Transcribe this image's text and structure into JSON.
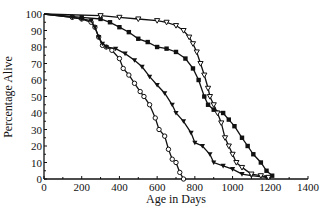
{
  "chart_data": {
    "type": "line",
    "title": "",
    "xlabel": "Age in Days",
    "ylabel": "Percentage Alive",
    "xlim": [
      0,
      1400
    ],
    "ylim": [
      0,
      100
    ],
    "x_ticks": [
      0,
      200,
      400,
      600,
      800,
      1000,
      1200,
      1400
    ],
    "y_ticks": [
      0,
      10,
      20,
      30,
      40,
      50,
      60,
      70,
      80,
      90,
      100
    ],
    "grid": false,
    "legend": null,
    "series": [
      {
        "name": "open-circles",
        "marker": "open-circle",
        "x": [
          0,
          150,
          200,
          250,
          270,
          290,
          310,
          330,
          360,
          400,
          420,
          450,
          480,
          510,
          530,
          560,
          590,
          610,
          640,
          660,
          680,
          700,
          720,
          740
        ],
        "y": [
          100,
          98,
          97,
          95,
          92,
          86,
          81,
          80,
          78,
          73,
          67,
          63,
          58,
          53,
          50,
          45,
          37,
          30,
          26,
          18,
          12,
          10,
          4,
          0
        ]
      },
      {
        "name": "filled-down-triangles",
        "marker": "filled-triangle-down",
        "x": [
          0,
          150,
          200,
          250,
          270,
          290,
          310,
          330,
          380,
          430,
          480,
          520,
          560,
          600,
          640,
          680,
          700,
          740,
          780,
          800,
          840,
          880,
          900,
          950,
          1000,
          1050,
          1100,
          1180
        ],
        "y": [
          100,
          98,
          97,
          96,
          92,
          86,
          82,
          80,
          79,
          76,
          72,
          68,
          62,
          57,
          52,
          45,
          40,
          35,
          28,
          22,
          20,
          15,
          10,
          8,
          6,
          3,
          2,
          1
        ]
      },
      {
        "name": "filled-squares",
        "marker": "filled-square",
        "x": [
          0,
          200,
          300,
          350,
          400,
          450,
          500,
          550,
          600,
          650,
          700,
          750,
          790,
          820,
          850,
          870,
          900,
          950,
          980,
          1010,
          1050,
          1080,
          1110,
          1150,
          1180,
          1210
        ],
        "y": [
          100,
          98,
          97,
          95,
          92,
          89,
          85,
          83,
          80,
          79,
          77,
          73,
          67,
          60,
          50,
          45,
          42,
          40,
          36,
          32,
          25,
          20,
          15,
          10,
          5,
          2
        ]
      },
      {
        "name": "open-down-triangles",
        "marker": "open-triangle-down",
        "x": [
          0,
          300,
          400,
          500,
          600,
          650,
          700,
          740,
          770,
          790,
          810,
          830,
          850,
          870,
          880,
          900,
          920,
          940,
          960,
          980,
          1000,
          1020,
          1050,
          1100,
          1150,
          1190
        ],
        "y": [
          100,
          99,
          98,
          97,
          96,
          95,
          93,
          90,
          86,
          82,
          77,
          70,
          63,
          55,
          50,
          45,
          40,
          34,
          25,
          20,
          15,
          10,
          7,
          3,
          2,
          1
        ]
      }
    ]
  },
  "axes": {
    "xlabel": "Age in Days",
    "ylabel": "Percentage Alive"
  }
}
